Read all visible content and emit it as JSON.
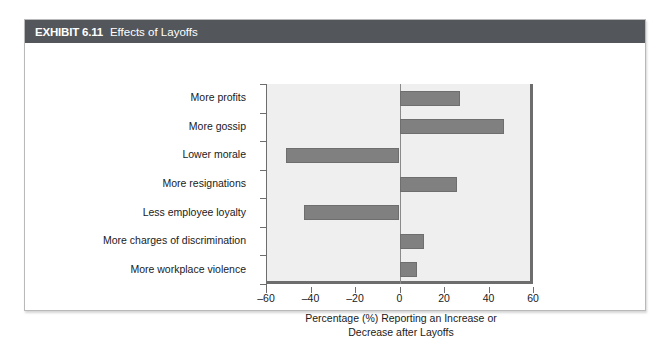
{
  "exhibit": {
    "label": "EXHIBIT 6.11",
    "title": "Effects of Layoffs",
    "header_bg": "#53565a",
    "border_color": "#b9b9b9"
  },
  "chart_data": {
    "type": "bar",
    "orientation": "horizontal",
    "title": "Effects of Layoffs",
    "categories": [
      "More profits",
      "More gossip",
      "Lower morale",
      "More resignations",
      "Less employee loyalty",
      "More charges of discrimination",
      "More workplace violence"
    ],
    "values": [
      27,
      47,
      -51,
      26,
      -43,
      11,
      8
    ],
    "xlabel": "Percentage (%) Reporting an Increase or Decrease after Layoffs",
    "xlabel_line1": "Percentage (%) Reporting an Increase or",
    "xlabel_line2": "Decrease after Layoffs",
    "ylabel": "",
    "xlim": [
      -60,
      60
    ],
    "xticks": [
      -60,
      -40,
      -20,
      0,
      20,
      40,
      60
    ],
    "xticklabels": [
      "–60",
      "–40",
      "–20",
      "0",
      "20",
      "40",
      "60"
    ],
    "grid": false,
    "legend": false,
    "bar_color": "#808080",
    "plot_bg": "#efefef",
    "axis_color": "#6d6d6d"
  }
}
